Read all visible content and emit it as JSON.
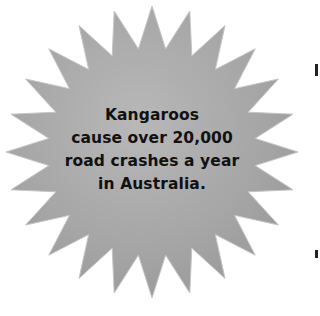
{
  "callout": {
    "lines": [
      "Kangaroos",
      "cause over 20,000",
      "road crashes a year",
      "in Australia."
    ],
    "shape": "starburst",
    "fill_color": "#a9a9a9",
    "highlight_color": "#c9c9c9",
    "text_color": "#111111"
  }
}
